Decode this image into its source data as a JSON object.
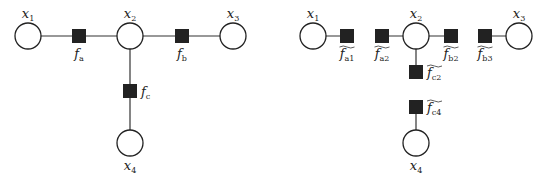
{
  "left_graph": {
    "variables": [
      {
        "id": "x1",
        "label": "x",
        "sub": "1",
        "cx": 28,
        "cy": 36
      },
      {
        "id": "x2",
        "label": "x",
        "sub": "2",
        "cx": 130,
        "cy": 36
      },
      {
        "id": "x3",
        "label": "x",
        "sub": "3",
        "cx": 233,
        "cy": 36
      },
      {
        "id": "x4",
        "label": "x",
        "sub": "4",
        "cx": 130,
        "cy": 143
      }
    ],
    "factors": [
      {
        "id": "fa",
        "label": "f",
        "sub": "a",
        "cx": 79,
        "cy": 36,
        "tilde": false
      },
      {
        "id": "fb",
        "label": "f",
        "sub": "b",
        "cx": 182,
        "cy": 36,
        "tilde": false
      },
      {
        "id": "fc",
        "label": "f",
        "sub": "c",
        "cx": 130,
        "cy": 91,
        "tilde": false
      }
    ],
    "edges": [
      [
        "x1",
        "fa"
      ],
      [
        "fa",
        "x2"
      ],
      [
        "x2",
        "fb"
      ],
      [
        "fb",
        "x3"
      ],
      [
        "x2",
        "fc"
      ],
      [
        "fc",
        "x4"
      ]
    ]
  },
  "right_graph": {
    "variables": [
      {
        "id": "x1",
        "label": "x",
        "sub": "1",
        "cx": 313,
        "cy": 36
      },
      {
        "id": "x2",
        "label": "x",
        "sub": "2",
        "cx": 416,
        "cy": 36
      },
      {
        "id": "x3",
        "label": "x",
        "sub": "3",
        "cx": 519,
        "cy": 36
      },
      {
        "id": "x4",
        "label": "x",
        "sub": "4",
        "cx": 416,
        "cy": 143
      }
    ],
    "factors": [
      {
        "id": "fa1",
        "label": "f",
        "sub": "a1",
        "cx": 347,
        "cy": 36,
        "tilde": true
      },
      {
        "id": "fa2",
        "label": "f",
        "sub": "a2",
        "cx": 382,
        "cy": 36,
        "tilde": true
      },
      {
        "id": "fb2",
        "label": "f",
        "sub": "b2",
        "cx": 451,
        "cy": 36,
        "tilde": true
      },
      {
        "id": "fb3",
        "label": "f",
        "sub": "b3",
        "cx": 485,
        "cy": 36,
        "tilde": true
      },
      {
        "id": "fc2",
        "label": "f",
        "sub": "c2",
        "cx": 416,
        "cy": 72,
        "tilde": true
      },
      {
        "id": "fc4",
        "label": "f",
        "sub": "c4",
        "cx": 416,
        "cy": 107,
        "tilde": true
      }
    ],
    "edges": [
      [
        "x1",
        "fa1"
      ],
      [
        "fa2",
        "x2"
      ],
      [
        "x2",
        "fb2"
      ],
      [
        "fb3",
        "x3"
      ],
      [
        "x2",
        "fc2"
      ],
      [
        "fc4",
        "x4"
      ]
    ]
  },
  "style": {
    "node_stroke": "#222222",
    "factor_fill": "#222222",
    "edge_color": "#333333",
    "background": "#ffffff"
  }
}
